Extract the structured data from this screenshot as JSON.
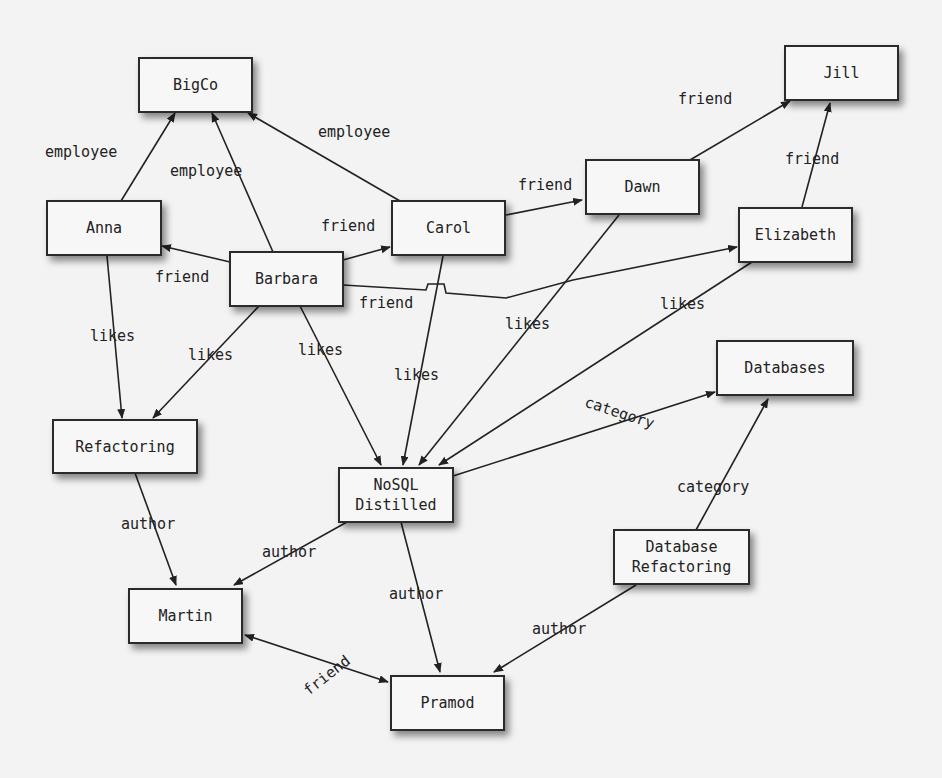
{
  "colors": {
    "background": "#f3f3f3",
    "node_fill": "#f7f7f7",
    "stroke": "#222222"
  },
  "nodes": {
    "bigco": "BigCo",
    "anna": "Anna",
    "barbara": "Barbara",
    "carol": "Carol",
    "dawn": "Dawn",
    "jill": "Jill",
    "elizabeth": "Elizabeth",
    "refactoring": "Refactoring",
    "nosql": "NoSQL\nDistilled",
    "databases": "Databases",
    "database_refactoring": "Database\nRefactoring",
    "martin": "Martin",
    "pramod": "Pramod"
  },
  "edges": [
    {
      "from": "Anna",
      "to": "BigCo",
      "label": "employee"
    },
    {
      "from": "Barbara",
      "to": "BigCo",
      "label": "employee"
    },
    {
      "from": "Carol",
      "to": "BigCo",
      "label": "employee"
    },
    {
      "from": "Barbara",
      "to": "Anna",
      "label": "friend"
    },
    {
      "from": "Barbara",
      "to": "Carol",
      "label": "friend"
    },
    {
      "from": "Barbara",
      "to": "Elizabeth",
      "label": "friend"
    },
    {
      "from": "Carol",
      "to": "Dawn",
      "label": "friend"
    },
    {
      "from": "Dawn",
      "to": "Jill",
      "label": "friend"
    },
    {
      "from": "Elizabeth",
      "to": "Jill",
      "label": "friend"
    },
    {
      "from": "Anna",
      "to": "Refactoring",
      "label": "likes"
    },
    {
      "from": "Barbara",
      "to": "Refactoring",
      "label": "likes"
    },
    {
      "from": "Barbara",
      "to": "NoSQL Distilled",
      "label": "likes"
    },
    {
      "from": "Carol",
      "to": "NoSQL Distilled",
      "label": "likes"
    },
    {
      "from": "Dawn",
      "to": "NoSQL Distilled",
      "label": "likes"
    },
    {
      "from": "Elizabeth",
      "to": "NoSQL Distilled",
      "label": "likes"
    },
    {
      "from": "NoSQL Distilled",
      "to": "Databases",
      "label": "category"
    },
    {
      "from": "Database Refactoring",
      "to": "Databases",
      "label": "category"
    },
    {
      "from": "Refactoring",
      "to": "Martin",
      "label": "author"
    },
    {
      "from": "NoSQL Distilled",
      "to": "Martin",
      "label": "author"
    },
    {
      "from": "NoSQL Distilled",
      "to": "Pramod",
      "label": "author"
    },
    {
      "from": "Database Refactoring",
      "to": "Pramod",
      "label": "author"
    },
    {
      "from": "Martin",
      "to": "Pramod",
      "label": "friend",
      "bidirectional": true
    }
  ],
  "labels": {
    "anna_bigco": "employee",
    "barbara_bigco": "employee",
    "carol_bigco": "employee",
    "barbara_anna": "friend",
    "barbara_carol": "friend",
    "barbara_elizabeth": "friend",
    "carol_dawn": "friend",
    "dawn_jill": "friend",
    "elizabeth_jill": "friend",
    "anna_refactoring": "likes",
    "barbara_refactoring": "likes",
    "barbara_nosql": "likes",
    "carol_nosql": "likes",
    "dawn_nosql": "likes",
    "elizabeth_nosql": "likes",
    "nosql_databases": "category",
    "dbref_databases": "category",
    "refactoring_martin": "author",
    "nosql_martin": "author",
    "nosql_pramod": "author",
    "dbref_pramod": "author",
    "martin_pramod": "friend"
  }
}
